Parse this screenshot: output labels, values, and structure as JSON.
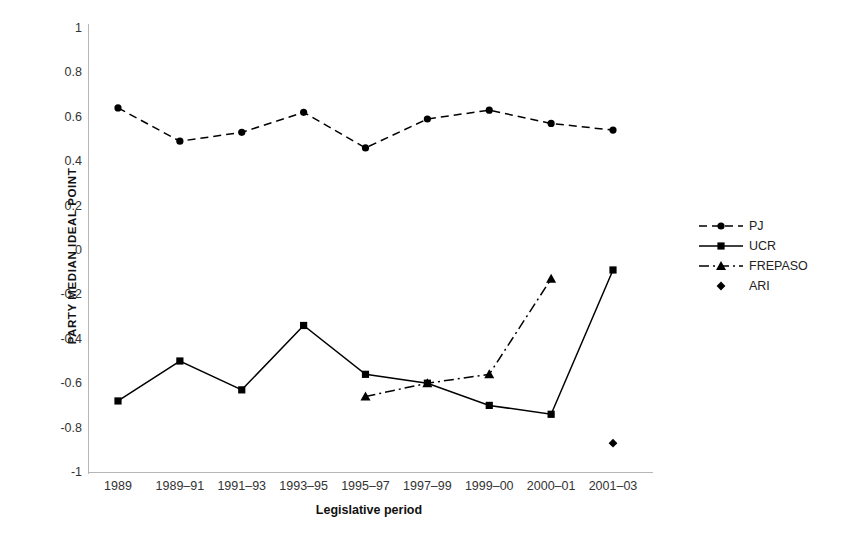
{
  "chart_data": {
    "type": "line",
    "title": "",
    "xlabel": "Legislative period",
    "ylabel": "PARTY MEDIAN IDEAL POINT",
    "ylim": [
      -1,
      1
    ],
    "ytick_labels": [
      "1",
      "0.8",
      "0.6",
      "0.4",
      "0.2",
      "0",
      "-0.2",
      "-0.4",
      "-0.6",
      "-0.8",
      "-1"
    ],
    "ytick_values": [
      1,
      0.8,
      0.6,
      0.4,
      0.2,
      0,
      -0.2,
      -0.4,
      -0.6,
      -0.8,
      -1
    ],
    "grid": false,
    "legend_position": "right",
    "categories": [
      "1989",
      "1989–91",
      "1991–93",
      "1993–95",
      "1995–97",
      "1997–99",
      "1999–00",
      "2000–01",
      "2001–03"
    ],
    "series": [
      {
        "name": "PJ",
        "marker": "circle",
        "linestyle": "dashed",
        "color": "#000000",
        "values": [
          0.64,
          0.49,
          0.53,
          0.62,
          0.46,
          0.59,
          0.63,
          0.57,
          0.54
        ]
      },
      {
        "name": "UCR",
        "marker": "square",
        "linestyle": "solid",
        "color": "#000000",
        "values": [
          -0.68,
          -0.5,
          -0.63,
          -0.34,
          -0.56,
          -0.6,
          -0.7,
          -0.74,
          -0.09
        ]
      },
      {
        "name": "FREPASO",
        "marker": "triangle",
        "linestyle": "dashdot",
        "color": "#000000",
        "values": [
          null,
          null,
          null,
          null,
          -0.66,
          -0.6,
          -0.56,
          -0.13,
          null
        ]
      },
      {
        "name": "ARI",
        "marker": "diamond",
        "linestyle": "none",
        "color": "#000000",
        "values": [
          null,
          null,
          null,
          null,
          null,
          null,
          null,
          null,
          -0.87
        ]
      }
    ]
  },
  "legend": {
    "items": [
      {
        "label": "PJ"
      },
      {
        "label": "UCR"
      },
      {
        "label": "FREPASO"
      },
      {
        "label": "ARI"
      }
    ]
  }
}
